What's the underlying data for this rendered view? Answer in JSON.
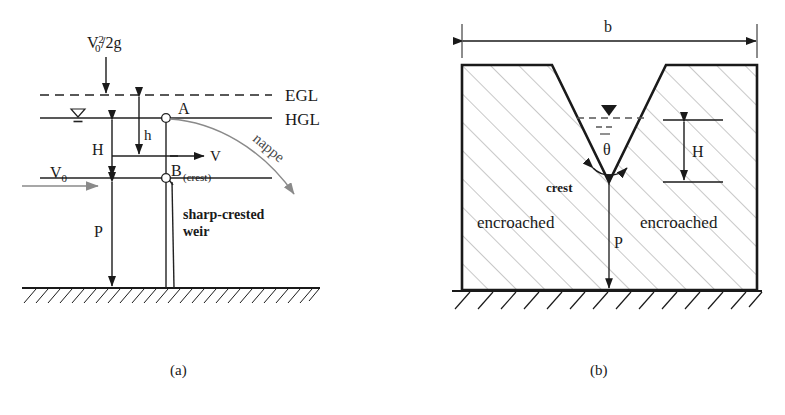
{
  "figure": {
    "panels": [
      {
        "id": "a",
        "caption": "(a)",
        "name": "sharp-crested-weir-profile",
        "labels": {
          "velocity_head": "V",
          "velocity_head_sub": "0",
          "velocity_head_sup": "2",
          "velocity_head_tail": "/2g",
          "egl": "EGL",
          "hgl": "HGL",
          "point_a": "A",
          "point_b": "B",
          "point_b_sub": "(crest)",
          "head_h_small": "h",
          "head_H": "H",
          "height_P": "P",
          "velocity_v": "V",
          "approach_velocity": "V",
          "approach_velocity_sub": "0",
          "nappe": "nappe",
          "weir_line1": "sharp-crested",
          "weir_line2": "weir"
        }
      },
      {
        "id": "b",
        "caption": "(b)",
        "name": "v-notch-weir-section",
        "labels": {
          "channel_width": "b",
          "angle": "θ",
          "crest": "crest",
          "head_H": "H",
          "height_P": "P",
          "encroached_left": "encroached",
          "encroached_right": "encroached"
        }
      }
    ]
  },
  "colors": {
    "ink": "#1a1a1a",
    "line": "#222222",
    "gray_arrow": "#808080",
    "hatch": "#9a9a9a",
    "ground": "#1a1a1a",
    "water": "#333333",
    "nappe": "#8a8a8a"
  }
}
